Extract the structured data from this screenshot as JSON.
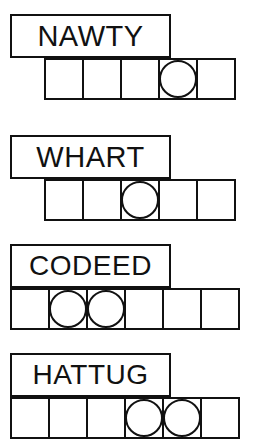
{
  "puzzle": {
    "background_color": "#ffffff",
    "ink_color": "#111111",
    "rows": [
      {
        "word": "NAWTY",
        "word_box": {
          "x": 10,
          "y": 14,
          "width": 161,
          "height": 44
        },
        "font_size": 29,
        "grid": {
          "x": 44,
          "y": 58,
          "cells": 5
        },
        "circled_cells": [
          4
        ]
      },
      {
        "word": "WHART",
        "word_box": {
          "x": 10,
          "y": 135,
          "width": 161,
          "height": 44
        },
        "font_size": 29,
        "grid": {
          "x": 44,
          "y": 179,
          "cells": 5
        },
        "circled_cells": [
          3
        ]
      },
      {
        "word": "CODEED",
        "word_box": {
          "x": 10,
          "y": 244,
          "width": 161,
          "height": 44
        },
        "font_size": 28,
        "grid": {
          "x": 10,
          "y": 288,
          "cells": 6
        },
        "circled_cells": [
          2,
          3
        ]
      },
      {
        "word": "HATTUG",
        "word_box": {
          "x": 10,
          "y": 353,
          "width": 161,
          "height": 44
        },
        "font_size": 28,
        "grid": {
          "x": 10,
          "y": 397,
          "cells": 6
        },
        "circled_cells": [
          4,
          5
        ]
      }
    ]
  }
}
